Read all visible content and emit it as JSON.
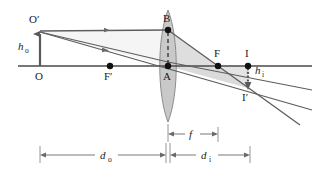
{
  "figure": {
    "type": "thin-lens-ray-diagram",
    "title": "",
    "background_color": "#ffffff",
    "line_color": "#3f3f3f",
    "lens_fill": "#c9c9c9",
    "shade_fill": "#d6d6d6",
    "point_color": "#111111"
  },
  "labels": {
    "object_top": "O′",
    "object_base": "O",
    "object_height": "h",
    "object_height_sub": "o",
    "near_focal_point": "F′",
    "lens_top": "B",
    "lens_center": "A",
    "far_focal_point": "F",
    "image_base": "I",
    "image_tip": "I′",
    "image_height": "h",
    "image_height_sub": "i",
    "object_distance": "d",
    "object_distance_sub": "o",
    "image_distance": "d",
    "image_distance_sub": "i",
    "focal_length": "f"
  },
  "geometry": {
    "axis_y": 66,
    "axis_x_start": 18,
    "axis_x_end": 312,
    "object_x": 40,
    "object_top_y": 32,
    "lens_x": 168,
    "lens_top_y": 10,
    "lens_bottom_y": 122,
    "lens_half_width": 11,
    "near_focal_x": 110,
    "far_focal_x": 218,
    "image_x": 248,
    "image_tip_y": 88
  },
  "dimensions": {
    "d_o_from_x": 40,
    "d_o_to_x": 168,
    "d_o_y": 155,
    "d_i_from_x": 168,
    "d_i_to_x": 250,
    "d_i_y": 155,
    "f_from_x": 168,
    "f_to_x": 218,
    "f_y": 134
  },
  "points": [
    {
      "name": "F-prime",
      "label": "F′",
      "x": 110,
      "y": 66
    },
    {
      "name": "B",
      "label": "B",
      "x": 168,
      "y": 30
    },
    {
      "name": "A",
      "label": "A",
      "x": 168,
      "y": 66
    },
    {
      "name": "F",
      "label": "F",
      "x": 218,
      "y": 66
    },
    {
      "name": "I",
      "label": "I",
      "x": 248,
      "y": 66
    }
  ]
}
